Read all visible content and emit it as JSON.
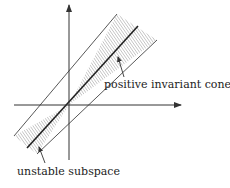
{
  "diagram": {
    "labels": {
      "cone": "positive invariant cone",
      "subspace": "unstable subspace"
    },
    "colors": {
      "line": "#333333",
      "hatch": "#888888",
      "background": "#ffffff"
    },
    "origin": [
      69,
      105
    ],
    "axes": {
      "horizontal": {
        "from": [
          14,
          105
        ],
        "to": [
          181,
          105
        ]
      },
      "vertical": {
        "from": [
          69,
          160
        ],
        "to": [
          69,
          5
        ]
      }
    },
    "cone_edges": {
      "upper_left": [
        117,
        14
      ],
      "upper_right": [
        157,
        40
      ],
      "lower_left": [
        14,
        136
      ],
      "lower_right": [
        37,
        154
      ]
    },
    "unstable_line": {
      "upper": [
        138,
        26
      ],
      "lower": [
        27,
        148
      ]
    }
  }
}
